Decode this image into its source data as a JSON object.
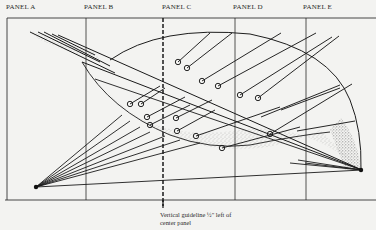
{
  "panels": [
    {
      "label": "PANEL A",
      "x": 6
    },
    {
      "label": "PANEL B",
      "x": 84
    },
    {
      "label": "PANEL C",
      "x": 162
    },
    {
      "label": "PANEL D",
      "x": 233
    },
    {
      "label": "PANEL E",
      "x": 303
    }
  ],
  "caption": {
    "line1": "Vertical guideline ½\" left of",
    "line2": "center panel"
  },
  "colors": {
    "background": "#f3f3f1",
    "ink": "#1d1d1d"
  }
}
